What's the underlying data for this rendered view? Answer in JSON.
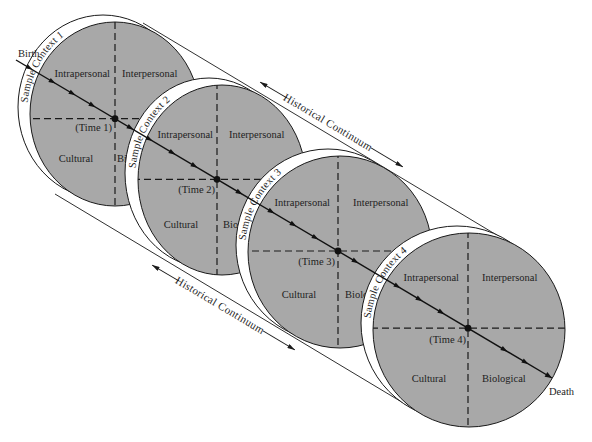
{
  "diagram": {
    "start_label": "Birth",
    "end_label": "Death",
    "continuum_top": "Historical Continuum",
    "continuum_bottom": "Historical Continuum",
    "contexts": [
      {
        "label": "Sample Context 1",
        "time": "(Time 1)",
        "quadrants": {
          "top_left": "Intrapersonal",
          "top_right": "Interpersonal",
          "bottom_left": "Cultural",
          "bottom_right": "Biological"
        }
      },
      {
        "label": "Sample Context 2",
        "time": "(Time 2)",
        "quadrants": {
          "top_left": "Intrapersonal",
          "top_right": "Interpersonal",
          "bottom_left": "Cultural",
          "bottom_right": "Biological"
        }
      },
      {
        "label": "Sample Context 3",
        "time": "(Time 3)",
        "quadrants": {
          "top_left": "Intrapersonal",
          "top_right": "Interpersonal",
          "bottom_left": "Cultural",
          "bottom_right": "Biological"
        }
      },
      {
        "label": "Sample Context 4",
        "time": "(Time 4)",
        "quadrants": {
          "top_left": "Intrapersonal",
          "top_right": "Interpersonal",
          "bottom_left": "Cultural",
          "bottom_right": "Biological"
        }
      }
    ]
  },
  "colors": {
    "disc_fill": "#a8a8a8",
    "rim_fill": "#ffffff",
    "line": "#1a1a1a",
    "background": "#ffffff"
  }
}
